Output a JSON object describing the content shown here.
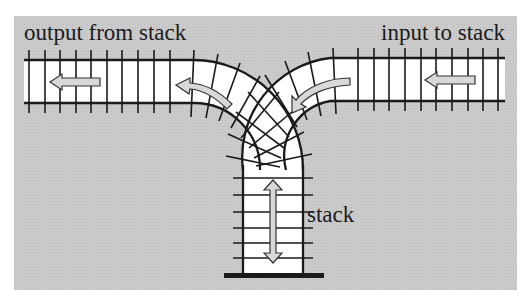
{
  "diagram": {
    "type": "railway-stack-analogy",
    "labels": {
      "output": "output from stack",
      "input": "input to stack",
      "stack": "stack"
    },
    "colors": {
      "background": "#c9c9c9",
      "track": "#ffffff",
      "rail": "#1a1a1a",
      "arrow_fill": "#d8d8d8"
    },
    "arrows": [
      {
        "name": "input-straight-arrow",
        "direction": "left"
      },
      {
        "name": "input-curve-arrow",
        "direction": "down-left"
      },
      {
        "name": "output-curve-arrow",
        "direction": "up-left"
      },
      {
        "name": "output-straight-arrow",
        "direction": "left"
      },
      {
        "name": "stack-arrow",
        "direction": "up-down"
      }
    ]
  }
}
